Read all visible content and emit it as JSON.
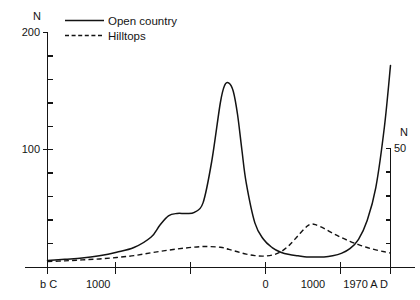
{
  "chart_data": {
    "type": "line",
    "title": "",
    "subtitle": "",
    "xlabel": "",
    "ylabel": "N",
    "ylabel_right": "N",
    "grid": false,
    "legend_position": "top-left",
    "axes": {
      "left": {
        "label": "N",
        "ticks": [
          0,
          100,
          200
        ],
        "tick_labels": [
          "",
          "100",
          "200"
        ],
        "ylim": [
          0,
          200
        ],
        "minor_ticks": 10
      },
      "right": {
        "label": "N",
        "ticks": [
          0,
          50
        ],
        "tick_labels": [
          "",
          "50"
        ],
        "ylim": [
          0,
          50
        ],
        "minor_ticks": 5
      },
      "x": {
        "tick_labels": [
          "b C",
          "1000",
          "",
          "0",
          "1000",
          "1970 A D"
        ],
        "era_start": "b C",
        "era_end": "1970 A D",
        "xlim": [
          -2000,
          1970
        ]
      }
    },
    "legend": [
      {
        "name": "Open country",
        "style": "solid",
        "axis": "left"
      },
      {
        "name": "Hilltops",
        "style": "dashed",
        "axis": "right"
      }
    ],
    "series": [
      {
        "name": "Open country",
        "style": "solid",
        "axis": "left",
        "x": [
          -2000,
          -1800,
          -1600,
          -1400,
          -1200,
          -1000,
          -800,
          -700,
          -600,
          -500,
          -400,
          -300,
          -200,
          -100,
          0,
          50,
          100,
          150,
          200,
          250,
          300,
          400,
          500,
          600,
          700,
          800,
          900,
          1000,
          1100,
          1200,
          1300,
          1400,
          1500,
          1600,
          1700,
          1800,
          1900,
          1970
        ],
        "y": [
          6,
          7,
          8,
          10,
          13,
          17,
          26,
          36,
          44,
          46,
          46,
          47,
          55,
          90,
          140,
          155,
          157,
          150,
          130,
          100,
          72,
          38,
          24,
          17,
          13,
          11,
          10,
          9,
          9,
          9,
          10,
          12,
          16,
          24,
          40,
          68,
          120,
          172
        ]
      },
      {
        "name": "Hilltops",
        "style": "dashed",
        "axis": "right",
        "x": [
          -2000,
          -1800,
          -1600,
          -1400,
          -1200,
          -1000,
          -800,
          -600,
          -400,
          -200,
          0,
          100,
          200,
          300,
          400,
          500,
          600,
          700,
          800,
          900,
          1000,
          1050,
          1100,
          1200,
          1300,
          1400,
          1500,
          1600,
          1700,
          1800,
          1900,
          1970
        ],
        "y": [
          2.5,
          2.8,
          3.2,
          3.6,
          4.2,
          5.0,
          6.2,
          7.3,
          8.2,
          8.8,
          8.5,
          7.6,
          6.6,
          5.6,
          5.0,
          4.8,
          5.2,
          6.6,
          9.4,
          13.4,
          17.2,
          18.2,
          18.0,
          16.4,
          14.4,
          12.6,
          11.0,
          9.6,
          8.4,
          7.4,
          6.6,
          6.1
        ]
      }
    ]
  }
}
